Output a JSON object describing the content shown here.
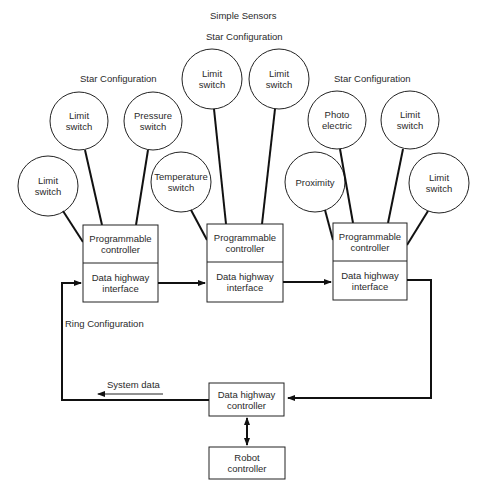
{
  "title": "Simple Sensors",
  "groups": [
    {
      "label": "Star Configuration",
      "sensors": [
        "Limit\nswitch",
        "Limit\nswitch",
        "Pressure\nswitch"
      ]
    },
    {
      "label": "Star Configuration",
      "sensors": [
        "Temperature\nswitch",
        "Limit\nswitch",
        "Limit\nswitch"
      ]
    },
    {
      "label": "Star Configuration",
      "sensors": [
        "Proximity",
        "Photo\nelectric",
        "Limit\nswitch",
        "Limit\nswitch"
      ]
    }
  ],
  "nodes": [
    {
      "top": "Programmable\ncontroller",
      "bottom": "Data highway\ninterface"
    },
    {
      "top": "Programmable\ncontroller",
      "bottom": "Data highway\ninterface"
    },
    {
      "top": "Programmable\ncontroller",
      "bottom": "Data highway\ninterface"
    }
  ],
  "ring_label": "Ring Configuration",
  "system_data_label": "System data",
  "data_highway_controller": "Data highway\ncontroller",
  "robot_controller": "Robot\ncontroller"
}
